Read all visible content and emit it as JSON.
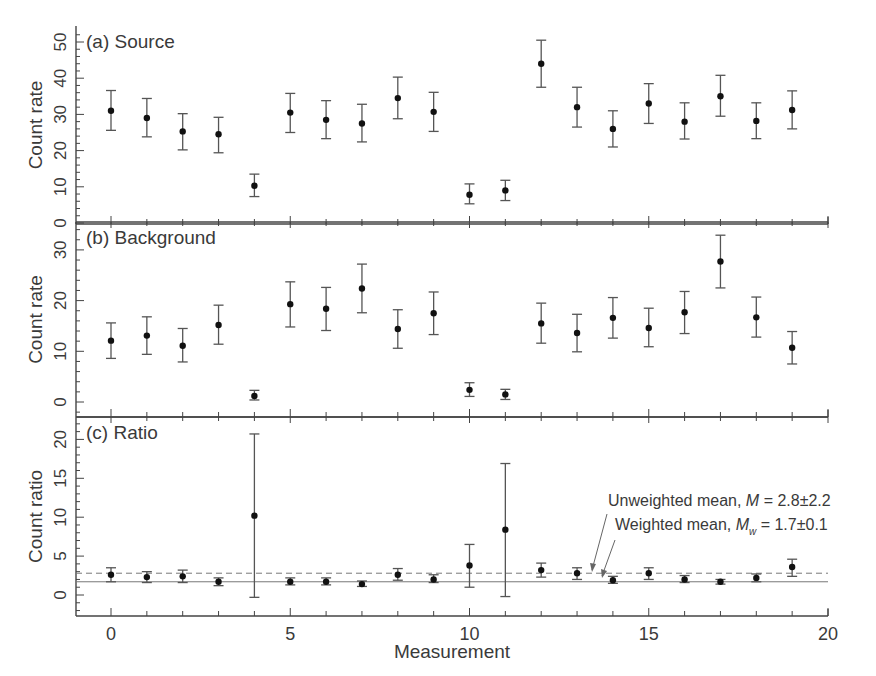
{
  "figure": {
    "xlabel": "Measurement",
    "x_ticks": [
      0,
      5,
      10,
      15,
      20
    ],
    "xlim": [
      -1,
      20
    ]
  },
  "chart_data": [
    {
      "type": "scatter",
      "panel": "a",
      "title": "(a) Source",
      "xlabel": "Measurement",
      "ylabel": "Count rate",
      "ylim": [
        0,
        53
      ],
      "y_ticks": [
        0,
        10,
        20,
        30,
        40,
        50
      ],
      "x": [
        0,
        1,
        2,
        3,
        4,
        5,
        6,
        7,
        8,
        9,
        10,
        11,
        12,
        13,
        14,
        15,
        16,
        17,
        18,
        19
      ],
      "values": [
        31,
        29,
        25.3,
        24.5,
        10.3,
        30.5,
        28.5,
        27.5,
        34.5,
        30.7,
        7.8,
        9.0,
        44,
        32,
        26,
        33,
        28,
        35,
        28.2,
        31.2
      ],
      "err_low": [
        25.6,
        23.8,
        20.2,
        19.4,
        7.3,
        25.0,
        23.3,
        22.4,
        28.8,
        25.3,
        5.3,
        6.2,
        37.5,
        26.5,
        21.0,
        27.5,
        23.2,
        29.5,
        23.3,
        26.0
      ],
      "err_high": [
        36.6,
        34.4,
        30.2,
        29.2,
        13.5,
        35.8,
        33.8,
        32.8,
        40.3,
        36.1,
        10.8,
        11.8,
        50.5,
        37.5,
        31.0,
        38.5,
        33.2,
        40.8,
        33.2,
        36.5
      ]
    },
    {
      "type": "scatter",
      "panel": "b",
      "title": "(b) Background",
      "xlabel": "Measurement",
      "ylabel": "Count rate",
      "ylim": [
        -3,
        35
      ],
      "y_ticks": [
        0,
        10,
        20,
        30
      ],
      "x": [
        0,
        1,
        2,
        3,
        4,
        5,
        6,
        7,
        8,
        9,
        10,
        11,
        12,
        13,
        14,
        15,
        16,
        17,
        18,
        19
      ],
      "values": [
        12.1,
        13.1,
        11.1,
        15.2,
        1.2,
        19.3,
        18.4,
        22.4,
        14.4,
        17.5,
        2.4,
        1.5,
        15.5,
        13.6,
        16.6,
        14.6,
        17.7,
        27.7,
        16.7,
        10.7
      ],
      "err_low": [
        8.6,
        9.4,
        7.9,
        11.4,
        0.4,
        14.8,
        14.1,
        17.6,
        10.6,
        13.3,
        1.1,
        0.5,
        11.6,
        9.9,
        12.6,
        10.9,
        13.5,
        22.5,
        12.8,
        7.5
      ],
      "err_high": [
        15.6,
        16.8,
        14.5,
        19.1,
        2.3,
        23.7,
        22.6,
        27.2,
        18.2,
        21.7,
        3.8,
        2.5,
        19.5,
        17.3,
        20.6,
        18.5,
        21.8,
        32.9,
        20.7,
        13.9
      ]
    },
    {
      "type": "scatter",
      "panel": "c",
      "title": "(c) Ratio",
      "xlabel": "Measurement",
      "ylabel": "Count ratio",
      "ylim": [
        -2.7,
        23
      ],
      "y_ticks": [
        0,
        5,
        10,
        15,
        20
      ],
      "x": [
        0,
        1,
        2,
        3,
        4,
        5,
        6,
        7,
        8,
        9,
        10,
        11,
        12,
        13,
        14,
        15,
        16,
        17,
        18,
        19
      ],
      "values": [
        2.6,
        2.3,
        2.4,
        1.7,
        10.2,
        1.7,
        1.7,
        1.4,
        2.6,
        2.0,
        3.8,
        8.4,
        3.2,
        2.8,
        1.9,
        2.8,
        2.0,
        1.7,
        2.2,
        3.6
      ],
      "err_low": [
        1.7,
        1.6,
        1.6,
        1.2,
        -0.3,
        1.3,
        1.3,
        1.1,
        1.9,
        1.6,
        1.0,
        -0.2,
        2.3,
        2.0,
        1.5,
        2.0,
        1.6,
        1.4,
        1.7,
        2.4
      ],
      "err_high": [
        3.5,
        3.0,
        3.2,
        2.2,
        20.7,
        2.2,
        2.2,
        1.8,
        3.4,
        2.6,
        6.5,
        16.9,
        4.1,
        3.5,
        2.4,
        3.5,
        2.5,
        2.0,
        2.7,
        4.6
      ],
      "reference_lines": [
        {
          "name": "Unweighted mean",
          "value": 2.8,
          "style": "dashed"
        },
        {
          "name": "Weighted mean",
          "value": 1.7,
          "style": "solid"
        }
      ],
      "annotations": [
        {
          "text_prefix": "Unweighted mean, ",
          "symbol": "M",
          "subscript": "",
          "text_suffix": " = 2.8±2.2"
        },
        {
          "text_prefix": "Weighted mean, ",
          "symbol": "M",
          "subscript": "w",
          "text_suffix": " = 1.7±0.1"
        }
      ]
    }
  ]
}
